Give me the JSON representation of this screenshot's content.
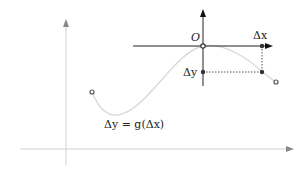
{
  "diagram": {
    "labels": {
      "origin": "O",
      "delta_x": "Δx",
      "delta_y": "Δy",
      "equation": "Δy = g(Δx)"
    },
    "colors": {
      "outer_axes": "#c8c8c8",
      "outer_arrow": "#888888",
      "curve": "#d6d6d6",
      "inner_axes": "#333333",
      "points": "#444444",
      "dotted": "#555555"
    }
  }
}
